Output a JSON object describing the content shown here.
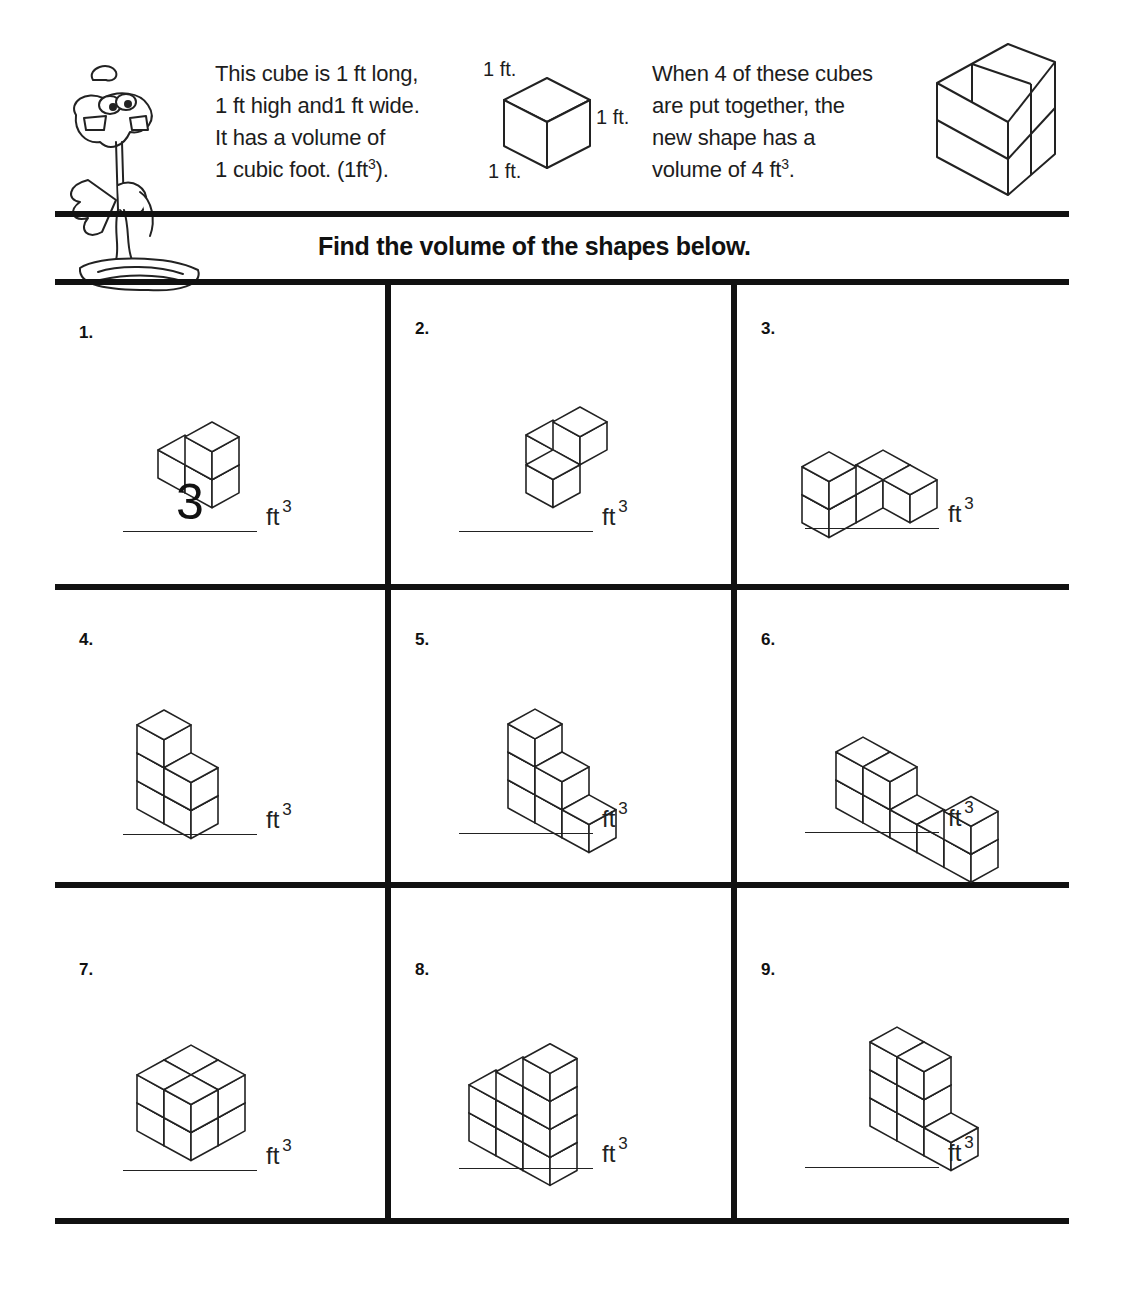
{
  "intro": {
    "left_lines": [
      "This cube is 1 ft long,",
      "1 ft high and1 ft wide.",
      "It has a volume of",
      "1 cubic foot. (1ft"
    ],
    "left_last_sup": "3",
    "left_last_tail": ").",
    "dim_top": "1 ft.",
    "dim_right": "1 ft.",
    "dim_bottom": "1 ft.",
    "right_lines": [
      "When 4 of these cubes",
      "are put together, the",
      "new shape has a",
      "volume of 4 ft"
    ],
    "right_last_sup": "3",
    "right_last_tail": "."
  },
  "title": "Find the volume of the shapes below.",
  "unit": "ft",
  "unit_sup": "3",
  "problems": [
    {
      "number": "1.",
      "answer": "3",
      "cubes": [
        [
          0,
          0,
          0
        ],
        [
          1,
          0,
          0
        ],
        [
          1,
          0,
          1
        ]
      ]
    },
    {
      "number": "2.",
      "answer": "",
      "cubes": [
        [
          1,
          1,
          0
        ],
        [
          0,
          0,
          0
        ],
        [
          1,
          0,
          1
        ]
      ]
    },
    {
      "number": "3.",
      "answer": "",
      "cubes": [
        [
          0,
          2,
          0
        ],
        [
          0,
          2,
          1
        ],
        [
          0,
          1,
          0
        ],
        [
          0,
          0,
          0
        ],
        [
          1,
          0,
          0
        ]
      ]
    },
    {
      "number": "4.",
      "answer": "",
      "cubes": [
        [
          0,
          1,
          0
        ],
        [
          0,
          1,
          1
        ],
        [
          1,
          1,
          0
        ],
        [
          1,
          1,
          1
        ],
        [
          0,
          1,
          2
        ]
      ]
    },
    {
      "number": "5.",
      "answer": "",
      "cubes": [
        [
          0,
          0,
          0
        ],
        [
          0,
          0,
          1
        ],
        [
          0,
          0,
          2
        ],
        [
          1,
          0,
          0
        ],
        [
          1,
          0,
          1
        ],
        [
          2,
          0,
          0
        ]
      ]
    },
    {
      "number": "6.",
      "answer": "",
      "cubes": [
        [
          0,
          0,
          0
        ],
        [
          0,
          0,
          1
        ],
        [
          1,
          0,
          0
        ],
        [
          1,
          0,
          1
        ],
        [
          2,
          0,
          0
        ],
        [
          3,
          0,
          0
        ],
        [
          4,
          0,
          0
        ],
        [
          4,
          0,
          1
        ]
      ]
    },
    {
      "number": "7.",
      "answer": "",
      "cubes": [
        [
          0,
          1,
          0
        ],
        [
          1,
          1,
          0
        ],
        [
          0,
          0,
          0
        ],
        [
          1,
          0,
          0
        ],
        [
          0,
          1,
          1
        ],
        [
          1,
          1,
          1
        ],
        [
          0,
          0,
          1
        ],
        [
          1,
          0,
          1
        ]
      ]
    },
    {
      "number": "8.",
      "answer": "",
      "cubes": [
        [
          2,
          1,
          0
        ],
        [
          2,
          1,
          1
        ],
        [
          2,
          1,
          2
        ],
        [
          2,
          1,
          3
        ],
        [
          1,
          1,
          0
        ],
        [
          1,
          1,
          1
        ],
        [
          1,
          1,
          2
        ],
        [
          0,
          1,
          0
        ],
        [
          0,
          1,
          1
        ]
      ]
    },
    {
      "number": "9.",
      "answer": "",
      "cubes": [
        [
          0,
          0,
          0
        ],
        [
          0,
          0,
          1
        ],
        [
          0,
          0,
          2
        ],
        [
          1,
          0,
          0
        ],
        [
          1,
          0,
          1
        ],
        [
          1,
          0,
          2
        ],
        [
          2,
          0,
          0
        ]
      ]
    }
  ]
}
